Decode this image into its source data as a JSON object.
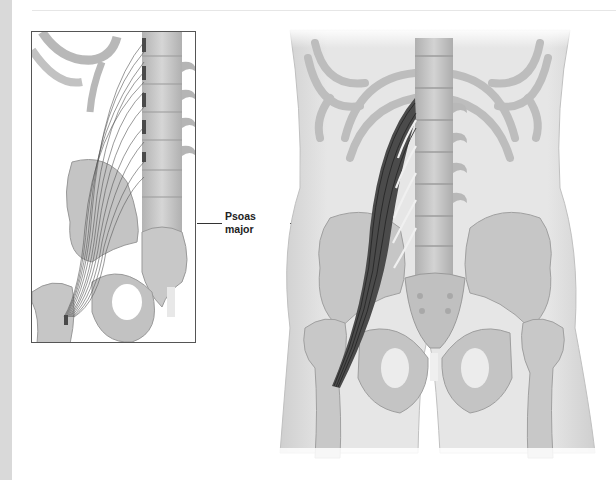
{
  "figure": {
    "label": {
      "line1": "Psoas",
      "line2": "major"
    },
    "panels": [
      {
        "name": "inset-detail",
        "description": "Lumbar spine with psoas major fiber origins and insertion"
      },
      {
        "name": "main-anterior-view",
        "description": "Anterior view of torso, pelvis and femurs with psoas major"
      }
    ],
    "colors": {
      "bone": "#c9c9c9",
      "bone_shade": "#a8a8a8",
      "body_outline": "#d4d4d4",
      "muscle": "#3d3d3d",
      "attachment": "#4a4a4a",
      "background": "#ffffff",
      "strip": "#d9d9d9"
    }
  }
}
